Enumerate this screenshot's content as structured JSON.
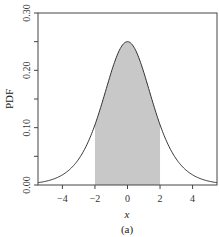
{
  "chart_data": {
    "type": "area",
    "title": "",
    "caption": "(a)",
    "xlabel": "x",
    "ylabel": "PDF",
    "xlim": [
      -5.5,
      5.5
    ],
    "ylim": [
      0,
      0.3
    ],
    "xticks": [
      -4,
      -2,
      0,
      2,
      4
    ],
    "xtick_labels": [
      "−4",
      "−2",
      "0",
      "2",
      "4"
    ],
    "yticks": [
      0.0,
      0.05,
      0.1,
      0.15,
      0.2,
      0.25,
      0.3
    ],
    "ytick_labels": [
      "0.00",
      "",
      "0.10",
      "",
      "0.20",
      "",
      "0.30"
    ],
    "grid": false,
    "legend": null,
    "series": [
      {
        "name": "Logistic PDF",
        "distribution": "logistic(0,1)",
        "x": [
          -5.5,
          -5,
          -4.5,
          -4,
          -3.5,
          -3,
          -2.5,
          -2,
          -1.5,
          -1,
          -0.5,
          0,
          0.5,
          1,
          1.5,
          2,
          2.5,
          3,
          3.5,
          4,
          4.5,
          5,
          5.5
        ],
        "y": [
          0.004,
          0.0066,
          0.0109,
          0.0177,
          0.0285,
          0.0452,
          0.0701,
          0.105,
          0.1491,
          0.1966,
          0.235,
          0.25,
          0.235,
          0.1966,
          0.1491,
          0.105,
          0.0701,
          0.0452,
          0.0285,
          0.0177,
          0.0109,
          0.0066,
          0.004
        ],
        "color": "#333333"
      }
    ],
    "shaded_region": {
      "x_from": -2,
      "x_to": 2,
      "fill": "#c8c8c8"
    }
  },
  "colors": {
    "axis": "#444444",
    "curve": "#333333",
    "shade": "#c8c8c8",
    "background": "#ffffff"
  }
}
